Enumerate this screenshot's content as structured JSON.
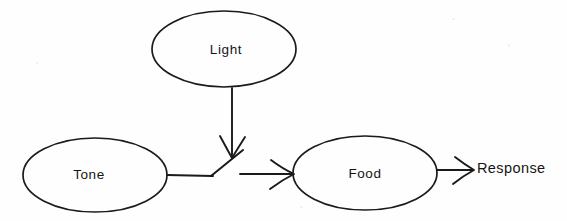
{
  "diagram": {
    "background_color": "#fefefe",
    "ink_color": "#1a1a1a",
    "nodes": [
      {
        "id": "light",
        "label": "Light",
        "shape": "ellipse",
        "cx": 224,
        "cy": 49,
        "rx": 72,
        "ry": 38
      },
      {
        "id": "tone",
        "label": "Tone",
        "shape": "ellipse",
        "cx": 95,
        "cy": 175,
        "rx": 72,
        "ry": 37
      },
      {
        "id": "food",
        "label": "Food",
        "shape": "ellipse",
        "cx": 365,
        "cy": 173,
        "rx": 72,
        "ry": 37
      }
    ],
    "free_labels": [
      {
        "id": "response",
        "label": "Response",
        "x": 477,
        "y": 169
      }
    ],
    "edges": [
      {
        "id": "light-to-switch",
        "from": "light",
        "to": "switch",
        "orientation": "vertical-down",
        "arrowhead": "open-v"
      },
      {
        "id": "tone-to-switch",
        "from": "tone",
        "to": "switch",
        "orientation": "horizontal-right",
        "arrowhead": "none"
      },
      {
        "id": "switch-to-food",
        "from": "switch",
        "to": "food",
        "orientation": "horizontal-right",
        "arrowhead": "open-v"
      },
      {
        "id": "food-to-response",
        "from": "food",
        "to": "response",
        "orientation": "horizontal-right",
        "arrowhead": "open-v"
      }
    ],
    "switch": {
      "id": "switch",
      "type": "toggle-switch-contact",
      "pivot_x": 212,
      "pivot_y": 175,
      "tip_x": 241,
      "tip_y": 151
    }
  }
}
